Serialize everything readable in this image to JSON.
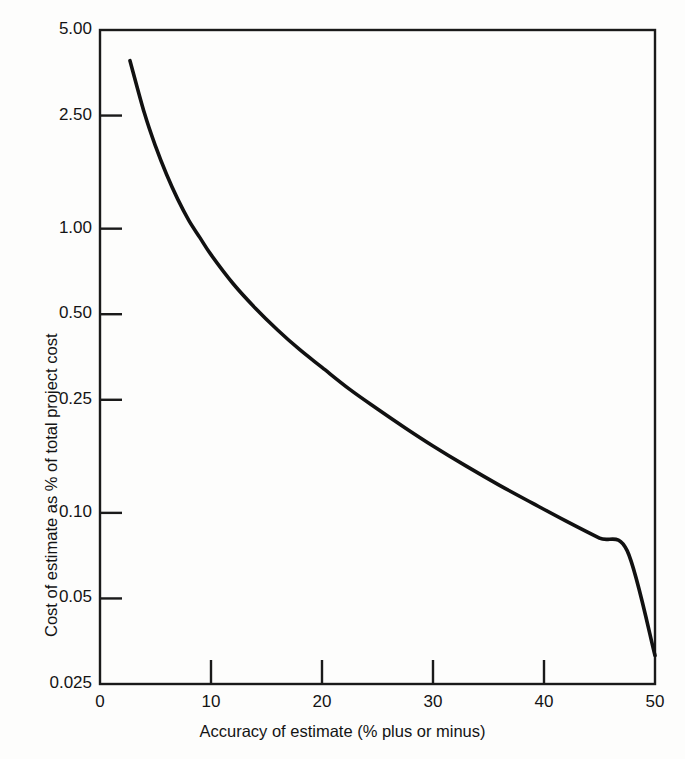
{
  "chart_data": {
    "type": "line",
    "title": "",
    "xlabel": "Accuracy of estimate (% plus or minus)",
    "ylabel": "Cost of estimate as % of total project cost",
    "xscale": "linear",
    "yscale": "log",
    "xlim": [
      0,
      50
    ],
    "ylim": [
      0.025,
      5.0
    ],
    "grid": false,
    "legend": null,
    "x_ticks": [
      0,
      10,
      20,
      30,
      40,
      50
    ],
    "x_tick_labels": [
      "0",
      "10",
      "20",
      "30",
      "40",
      "50"
    ],
    "y_ticks": [
      5.0,
      2.5,
      1.0,
      0.5,
      0.25,
      0.1,
      0.05,
      0.025
    ],
    "y_tick_labels": [
      "5.00",
      "2.50",
      "1.00",
      "0.50",
      "0.25",
      "0.10",
      "0.05",
      "0.025"
    ],
    "series": [
      {
        "name": "Cost of estimate",
        "x": [
          2.7,
          4,
          5,
          6,
          7,
          8,
          9,
          10,
          12,
          14,
          16,
          18,
          20,
          22.5,
          25,
          27.5,
          30,
          33,
          36,
          39,
          42,
          45,
          47.5,
          50
        ],
        "y": [
          3.9,
          2.55,
          1.95,
          1.55,
          1.27,
          1.07,
          0.93,
          0.81,
          0.64,
          0.525,
          0.44,
          0.375,
          0.325,
          0.272,
          0.232,
          0.199,
          0.172,
          0.146,
          0.125,
          0.108,
          0.0935,
          0.0815,
          0.0735,
          0.0315
        ]
      }
    ],
    "annotations": []
  },
  "axis": {
    "x_label": "Accuracy of estimate (% plus or minus)",
    "y_label": "Cost of estimate as % of total project cost"
  },
  "style": {
    "curve_color": "#111111",
    "frame_color": "#1a1a1a",
    "background": "#fdfdfc"
  }
}
